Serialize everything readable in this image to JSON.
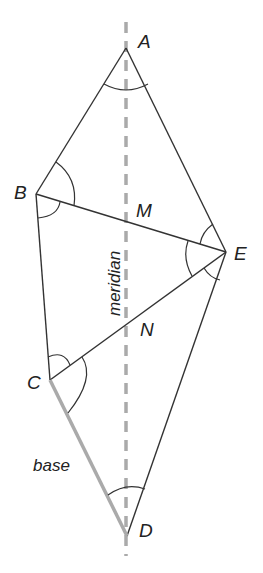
{
  "diagram": {
    "points": {
      "A": {
        "label": "A",
        "x": 126,
        "y": 48
      },
      "B": {
        "label": "B",
        "x": 36,
        "y": 194
      },
      "E": {
        "label": "E",
        "x": 226,
        "y": 252
      },
      "C": {
        "label": "C",
        "x": 50,
        "y": 380
      },
      "D": {
        "label": "D",
        "x": 127,
        "y": 536
      },
      "M": {
        "label": "M"
      },
      "N": {
        "label": "N"
      }
    },
    "meridian_label": "meridian",
    "base_label": "base",
    "colors": {
      "line": "#333333",
      "meridian": "#aaaaaa",
      "base": "#aaaaaa",
      "text": "#222222"
    }
  }
}
